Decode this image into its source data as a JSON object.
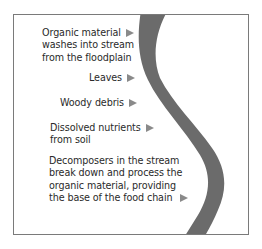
{
  "diagram": {
    "type": "stream-food-chain-inputs",
    "colors": {
      "stream": "#6b6b6b",
      "arrow": "#8a8a8a",
      "border": "#7a7a7a",
      "text": "#2a2a2a"
    },
    "labels": [
      {
        "id": "organic",
        "lines": [
          "Organic material",
          "washes into stream",
          "from the floodplain"
        ],
        "arrow_icon": "right-triangle"
      },
      {
        "id": "leaves",
        "lines": [
          "Leaves"
        ],
        "arrow_icon": "right-triangle"
      },
      {
        "id": "woody",
        "lines": [
          "Woody debris"
        ],
        "arrow_icon": "right-triangle"
      },
      {
        "id": "dissolved",
        "lines": [
          "Dissolved nutrients",
          "from soil"
        ],
        "arrow_icon": "right-triangle"
      },
      {
        "id": "decomposers",
        "lines": [
          "Decomposers in the stream",
          "break down and process the",
          "organic material, providing",
          "the base of the food chain"
        ],
        "arrow_icon": "right-triangle"
      }
    ]
  }
}
